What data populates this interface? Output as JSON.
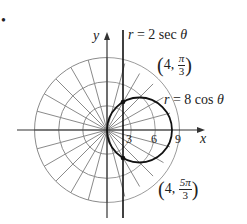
{
  "bullet": "•",
  "axes": {
    "x_label": "x",
    "y_label": "y",
    "ticks": [
      "3",
      "6",
      "9"
    ]
  },
  "curves": {
    "line": {
      "lhs": "r",
      "eq": "=",
      "rhs": "2 sec",
      "var": "θ"
    },
    "circle": {
      "lhs": "r",
      "eq": "=",
      "rhs": "8 cos",
      "var": "θ"
    }
  },
  "points": [
    {
      "r": "4,",
      "num": "π",
      "den": "3"
    },
    {
      "r": "4,",
      "num": "5π",
      "den": "3"
    }
  ],
  "colors": {
    "grid": "#8a8a8a",
    "axis": "#333333",
    "curve": "#111111"
  },
  "chart_data": {
    "type": "polar",
    "title": "",
    "grid": {
      "radii": [
        3,
        6,
        9
      ],
      "spoke_step_rad": "π/12"
    },
    "curves": [
      {
        "name": "r = 2 sec θ",
        "kind": "vertical line",
        "x": 2
      },
      {
        "name": "r = 8 cos θ",
        "kind": "circle",
        "center": [
          4,
          0
        ],
        "radius": 4
      }
    ],
    "intersections": [
      {
        "label": "(4, π/3)",
        "r": 4,
        "theta": "π/3"
      },
      {
        "label": "(4, 5π/3)",
        "r": 4,
        "theta": "5π/3"
      }
    ],
    "x_ticks": [
      3,
      6,
      9
    ],
    "xlabel": "x",
    "ylabel": "y"
  }
}
